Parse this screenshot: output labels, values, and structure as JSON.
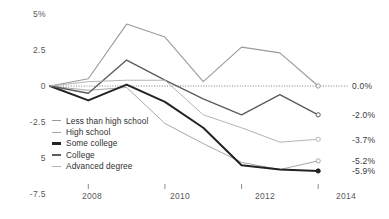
{
  "chart_data": {
    "type": "line",
    "title": "",
    "subtitle": "",
    "xlabel": "",
    "ylabel": "",
    "xlim": [
      2007,
      2014.7
    ],
    "ylim": [
      -7.5,
      5
    ],
    "grid": false,
    "zero_reference_line": true,
    "legend_position": "inside-left",
    "x": [
      2007,
      2008,
      2009,
      2010,
      2011,
      2012,
      2013,
      2014
    ],
    "y_ticks": [
      {
        "value": 5,
        "label": "5%"
      },
      {
        "value": 2.5,
        "label": "2.5"
      },
      {
        "value": 0,
        "label": "0"
      },
      {
        "value": -2.5,
        "label": "-2.5"
      },
      {
        "value": -5,
        "label": "5"
      },
      {
        "value": -7.5,
        "label": "-7.5"
      }
    ],
    "x_ticks": [
      {
        "value": 2008,
        "label": "2008"
      },
      {
        "value": 2010,
        "label": "2010"
      },
      {
        "value": 2012,
        "label": "2012"
      },
      {
        "value": 2014,
        "label": "2014"
      }
    ],
    "series": [
      {
        "name": "Less than high school",
        "color": "#9a9a9c",
        "width": 1.1,
        "marker": "open-circle",
        "end_label": "0.0%",
        "end_value": 0.0,
        "values": [
          0.0,
          0.5,
          4.3,
          3.4,
          0.3,
          2.7,
          2.3,
          0.0
        ]
      },
      {
        "name": "High school",
        "color": "#a8a8aa",
        "width": 1.0,
        "marker": "open-circle",
        "end_label": "-5.2%",
        "end_value": -5.2,
        "values": [
          0.0,
          -0.3,
          -0.1,
          -2.6,
          -4.0,
          -5.3,
          -5.8,
          -5.2
        ]
      },
      {
        "name": "Some college",
        "color": "#232325",
        "width": 2.0,
        "marker": "filled-circle",
        "end_label": "-5.9%",
        "end_value": -5.9,
        "values": [
          0.0,
          -1.0,
          0.1,
          -1.1,
          -2.9,
          -5.5,
          -5.8,
          -5.9
        ]
      },
      {
        "name": "College",
        "color": "#5c5c5e",
        "width": 1.4,
        "marker": "open-circle",
        "end_label": "-2.0%",
        "end_value": -2.0,
        "values": [
          0.0,
          -0.5,
          1.8,
          0.4,
          -0.9,
          -2.0,
          -0.6,
          -2.0
        ]
      },
      {
        "name": "Advanced degree",
        "color": "#b4b4b6",
        "width": 1.0,
        "marker": "open-circle",
        "end_label": "-3.7%",
        "end_value": -3.7,
        "values": [
          0.0,
          0.3,
          0.4,
          0.4,
          -2.0,
          -2.9,
          -3.9,
          -3.7
        ]
      }
    ]
  },
  "legend": {
    "items": [
      {
        "label": "Less than high school"
      },
      {
        "label": "High school"
      },
      {
        "label": "Some college"
      },
      {
        "label": "College"
      },
      {
        "label": "Advanced degree"
      }
    ]
  }
}
